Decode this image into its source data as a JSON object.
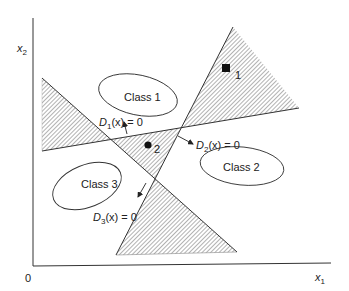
{
  "diagram": {
    "axes": {
      "x_label": "x",
      "x_sub": "1",
      "y_label": "x",
      "y_sub": "2",
      "origin_label": "0"
    },
    "classes": [
      {
        "label": "Class 1"
      },
      {
        "label": "Class 2"
      },
      {
        "label": "Class 3"
      }
    ],
    "boundaries": [
      {
        "name": "D",
        "sub": "1",
        "rest": "(x) = 0"
      },
      {
        "name": "D",
        "sub": "2",
        "rest": "(x) = 0"
      },
      {
        "name": "D",
        "sub": "3",
        "rest": "(x) = 0"
      }
    ],
    "points": [
      {
        "label": "1",
        "marker": "square"
      },
      {
        "label": "2",
        "marker": "circle"
      }
    ],
    "colors": {
      "line": "#333333",
      "hatch": "#555555",
      "background": "#ffffff"
    }
  }
}
